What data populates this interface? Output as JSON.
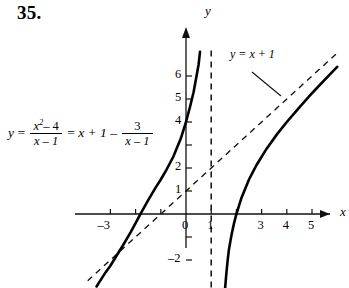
{
  "problem": {
    "number": "35."
  },
  "equation": {
    "lhs_var": "y",
    "eq1": "=",
    "frac1_num": "x",
    "frac1_num_sup": "2",
    "frac1_num_rest": "– 4",
    "frac1_den": "x – 1",
    "eq2": "=",
    "linear": "x + 1 –",
    "frac2_num": "3",
    "frac2_den": "x – 1"
  },
  "axes": {
    "x_label": "x",
    "y_label": "y",
    "x_ticks": [
      {
        "value": -3,
        "label": "–3"
      },
      {
        "value": -2,
        "label": ""
      },
      {
        "value": -1,
        "label": ""
      },
      {
        "value": 0,
        "label": "0"
      },
      {
        "value": 1,
        "label": "1"
      },
      {
        "value": 2,
        "label": ""
      },
      {
        "value": 3,
        "label": "3"
      },
      {
        "value": 4,
        "label": "4"
      },
      {
        "value": 5,
        "label": "5"
      }
    ],
    "y_ticks": [
      {
        "value": 6,
        "label": "6"
      },
      {
        "value": 5,
        "label": "5"
      },
      {
        "value": 4,
        "label": "4"
      },
      {
        "value": 3,
        "label": ""
      },
      {
        "value": 2,
        "label": "2"
      },
      {
        "value": 1,
        "label": "1"
      },
      {
        "value": -1,
        "label": ""
      },
      {
        "value": -2,
        "label": "–2"
      }
    ]
  },
  "annotations": {
    "slant_asymptote_label": "y = x + 1"
  },
  "chart_data": {
    "type": "line",
    "title": "",
    "xlabel": "x",
    "ylabel": "y",
    "xlim": [
      -3.9,
      6.1
    ],
    "ylim": [
      -3.2,
      7.2
    ],
    "grid": false,
    "legend": "none",
    "function": "y = (x^2 - 4)/(x - 1) = x + 1 - 3/(x - 1)",
    "vertical_asymptote": 1,
    "slant_asymptote": {
      "slope": 1,
      "intercept": 1,
      "label": "y = x + 1"
    },
    "x_intercepts": [
      -2,
      2
    ],
    "y_intercept": 4,
    "series": [
      {
        "name": "left-branch",
        "style": "solid",
        "points": [
          [
            -3.55,
            -3.15
          ],
          [
            -3.2,
            -2.55
          ],
          [
            -3.0,
            -2.25
          ],
          [
            -2.8,
            -1.89
          ],
          [
            -2.5,
            -1.36
          ],
          [
            -2.2,
            -0.8
          ],
          [
            -2.0,
            -0.4
          ],
          [
            -1.8,
            0.014
          ],
          [
            -1.5,
            0.6
          ],
          [
            -1.2,
            1.16
          ],
          [
            -1.0,
            1.5
          ],
          [
            -0.8,
            1.87
          ],
          [
            -0.5,
            2.5
          ],
          [
            -0.2,
            3.3
          ],
          [
            0.0,
            4.0
          ],
          [
            0.15,
            4.62
          ],
          [
            0.3,
            5.29
          ],
          [
            0.42,
            6.01
          ],
          [
            0.5,
            6.5
          ],
          [
            0.555,
            7.05
          ]
        ]
      },
      {
        "name": "right-branch",
        "style": "solid",
        "points": [
          [
            1.55,
            -3.25
          ],
          [
            1.6,
            -2.6
          ],
          [
            1.65,
            -2.05
          ],
          [
            1.7,
            -1.57
          ],
          [
            1.8,
            -0.95
          ],
          [
            1.9,
            -0.43
          ],
          [
            2.0,
            0.0
          ],
          [
            2.2,
            0.7
          ],
          [
            2.5,
            1.5
          ],
          [
            2.8,
            2.13
          ],
          [
            3.2,
            2.84
          ],
          [
            3.6,
            3.45
          ],
          [
            4.0,
            4.0
          ],
          [
            4.5,
            4.64
          ],
          [
            5.0,
            5.25
          ],
          [
            5.5,
            5.83
          ],
          [
            6.0,
            6.4
          ]
        ]
      },
      {
        "name": "slant-asymptote",
        "style": "dashed",
        "points": [
          [
            -3.9,
            -2.9
          ],
          [
            6.05,
            7.05
          ]
        ]
      },
      {
        "name": "vertical-asymptote",
        "style": "dashed",
        "points": [
          [
            1,
            -3.2
          ],
          [
            1,
            7.2
          ]
        ]
      }
    ]
  }
}
